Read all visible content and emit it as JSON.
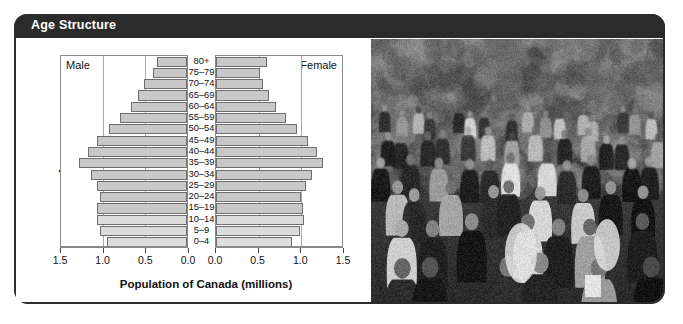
{
  "panel": {
    "title": "Age Structure",
    "title_bar_color": "#2b2b2b",
    "frame_color": "#2b2b2b",
    "background": "#ffffff"
  },
  "chart_data": {
    "type": "bar",
    "subtype": "population-pyramid",
    "title": "Age Structure",
    "xlabel": "Population of Canada (millions)",
    "ylabel": "Age",
    "grid": true,
    "legend_position": "inside-top-corners",
    "bar_fill": "#c8c8c8",
    "bar_fill_young": "#dcdcdc",
    "bar_stroke": "#6e6e6e",
    "xlim_left": [
      1.5,
      0.0
    ],
    "xlim_right": [
      0.0,
      1.5
    ],
    "left_ticks": [
      "1.5",
      "1.0",
      "0.5",
      "0.0"
    ],
    "right_ticks": [
      "0.0",
      "0.5",
      "1.0",
      "1.5"
    ],
    "left_tick_values": [
      1.5,
      1.0,
      0.5,
      0.0
    ],
    "right_tick_values": [
      0.0,
      0.5,
      1.0,
      1.5
    ],
    "categories": [
      "80+",
      "75–79",
      "70–74",
      "65–69",
      "60–64",
      "55–59",
      "50–54",
      "45–49",
      "40–44",
      "35–39",
      "30–34",
      "25–29",
      "20–24",
      "15–19",
      "10–14",
      "5–9",
      "0–4"
    ],
    "series": [
      {
        "name": "Male",
        "side": "left",
        "values": [
          0.35,
          0.4,
          0.5,
          0.58,
          0.66,
          0.78,
          0.92,
          1.05,
          1.16,
          1.27,
          1.12,
          1.05,
          1.02,
          1.05,
          1.05,
          1.02,
          0.94
        ]
      },
      {
        "name": "Female",
        "side": "right",
        "values": [
          0.6,
          0.52,
          0.55,
          0.62,
          0.7,
          0.82,
          0.95,
          1.08,
          1.18,
          1.25,
          1.12,
          1.05,
          1.0,
          1.02,
          1.03,
          0.98,
          0.89
        ]
      }
    ]
  },
  "labels": {
    "male": "Male",
    "female": "Female"
  }
}
